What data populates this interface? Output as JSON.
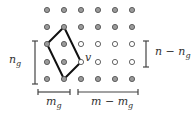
{
  "diagram": {
    "grid": {
      "cols_x": [
        47,
        64,
        81,
        98,
        115,
        132
      ],
      "rows_y": [
        10,
        27,
        44,
        62,
        79
      ],
      "dot_radius": 2.6,
      "filled_color": "#9a9a9a",
      "stroke_color": "#555555",
      "open_color": "#ffffff",
      "open_cells": [
        [
          2,
          2
        ],
        [
          2,
          3
        ],
        [
          2,
          4
        ],
        [
          2,
          5
        ],
        [
          3,
          2
        ],
        [
          3,
          3
        ],
        [
          3,
          4
        ],
        [
          3,
          5
        ]
      ]
    },
    "polygon": {
      "points": [
        [
          64,
          27
        ],
        [
          47,
          44
        ],
        [
          64,
          79
        ],
        [
          81,
          62
        ]
      ],
      "color": "#111111"
    },
    "vertex_label": "v",
    "left_bracket": {
      "label": "n",
      "sub": "g"
    },
    "right_bracket": {
      "label": "n − n",
      "sub": "g"
    },
    "bottom_left_bracket": {
      "label": "m",
      "sub": "g"
    },
    "bottom_right_bracket": {
      "label": "m − m",
      "sub": "g"
    }
  }
}
